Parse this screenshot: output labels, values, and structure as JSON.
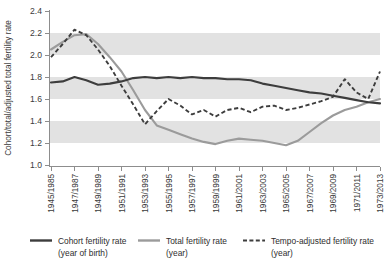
{
  "chart_data": {
    "type": "line",
    "title": "",
    "xlabel": "",
    "ylabel": "Cohort/total/adjusted total fertility rate",
    "ylim": [
      1.0,
      2.4
    ],
    "yticks": [
      "1.0",
      "1.2",
      "1.4",
      "1.6",
      "1.8",
      "2.0",
      "2.2",
      "2.4"
    ],
    "ytick_values": [
      1.0,
      1.2,
      1.4,
      1.6,
      1.8,
      2.0,
      2.2,
      2.4
    ],
    "grid": "horizontal-alternating-bands",
    "bands": [
      [
        1.2,
        1.4
      ],
      [
        1.6,
        1.8
      ],
      [
        2.0,
        2.2
      ]
    ],
    "legend_position": "bottom",
    "xtick_labels": [
      "1945/1985",
      "1947/1987",
      "1949/1989",
      "1951/1991",
      "1953/1993",
      "1955/1995",
      "1957/1997",
      "1959/1999",
      "1961/2001",
      "1963/2003",
      "1965/2005",
      "1967/2007",
      "1969/2009",
      "1971/2011",
      "1973/2013"
    ],
    "x": [
      1945,
      1946,
      1947,
      1948,
      1949,
      1950,
      1951,
      1952,
      1953,
      1954,
      1955,
      1956,
      1957,
      1958,
      1959,
      1960,
      1961,
      1962,
      1963,
      1964,
      1965,
      1966,
      1967,
      1968,
      1969,
      1970,
      1971,
      1972,
      1973
    ],
    "series": [
      {
        "name": "Cohort fertility rate (year of birth)",
        "color": "#3d3d3d",
        "style": "solid",
        "values": [
          1.75,
          1.76,
          1.8,
          1.77,
          1.73,
          1.74,
          1.76,
          1.79,
          1.8,
          1.79,
          1.8,
          1.79,
          1.8,
          1.79,
          1.79,
          1.78,
          1.78,
          1.77,
          1.74,
          1.72,
          1.7,
          1.68,
          1.66,
          1.65,
          1.63,
          1.61,
          1.59,
          1.57,
          1.56
        ]
      },
      {
        "name": "Total fertility rate (year)",
        "color": "#9b9b9b",
        "style": "solid",
        "values": [
          2.05,
          2.12,
          2.18,
          2.19,
          2.1,
          1.98,
          1.85,
          1.68,
          1.5,
          1.36,
          1.32,
          1.28,
          1.24,
          1.21,
          1.19,
          1.22,
          1.24,
          1.23,
          1.22,
          1.2,
          1.18,
          1.22,
          1.3,
          1.38,
          1.45,
          1.5,
          1.53,
          1.57,
          1.6
        ]
      },
      {
        "name": "Tempo-adjusted fertility rate (year)",
        "color": "#3d3d3d",
        "style": "dashed",
        "values": [
          1.98,
          2.1,
          2.23,
          2.18,
          2.05,
          1.9,
          1.72,
          1.55,
          1.37,
          1.49,
          1.6,
          1.54,
          1.46,
          1.5,
          1.44,
          1.5,
          1.52,
          1.48,
          1.53,
          1.54,
          1.5,
          1.52,
          1.55,
          1.58,
          1.62,
          1.78,
          1.66,
          1.6,
          1.85
        ]
      }
    ]
  },
  "legend": {
    "items": [
      {
        "line1": "Cohort fertility rate",
        "line2": "(year of birth)",
        "style": "solid-dark"
      },
      {
        "line1": "Total fertility rate",
        "line2": "(year)",
        "style": "solid-light"
      },
      {
        "line1": "Tempo-adjusted fertility rate",
        "line2": "(year)",
        "style": "dashed-dark"
      }
    ]
  },
  "colors": {
    "cohort": "#3d3d3d",
    "total": "#9b9b9b",
    "tempo": "#3d3d3d",
    "band": "#e2e2e2",
    "axis": "#8d8d8d"
  }
}
